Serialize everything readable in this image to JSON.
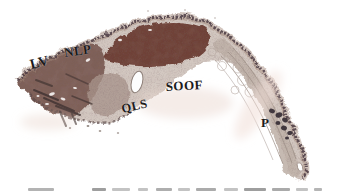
{
  "figure": {
    "type": "histology-micrograph",
    "labels": {
      "lv": "LV",
      "nlp": "NLP",
      "soof": "SOOF",
      "qls": "QLS",
      "p": "P"
    },
    "colors": {
      "background": "#ffffff",
      "tissue_base": "#d3c8c1",
      "muscle_mass": "#6f4238",
      "left_dark_mass": "#7e6058",
      "limb_band": "#c0b2aa",
      "dermis_band": "#a88e80",
      "edge_dark": "#4a3a42",
      "pigment_blobs": "#342b33",
      "lumen_white": "#fdfdfd",
      "label_text": "#1b1b1b"
    }
  }
}
